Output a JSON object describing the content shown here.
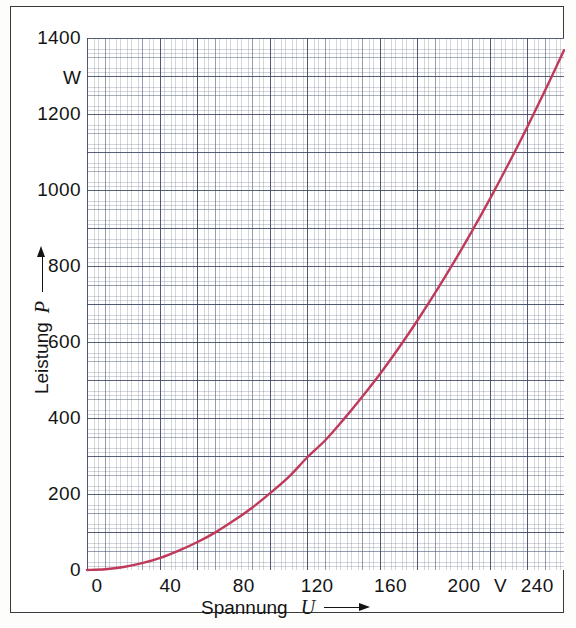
{
  "chart_data": {
    "type": "line",
    "title": "",
    "xlabel": "Spannung U",
    "ylabel": "Leistung P",
    "x_unit": "V",
    "y_unit": "W",
    "xlim": [
      0,
      260
    ],
    "ylim": [
      0,
      1400
    ],
    "grid": "graph-paper",
    "legend": "none",
    "x_ticks": [
      0,
      40,
      80,
      120,
      160,
      200,
      240
    ],
    "x_tick_labels": [
      "0",
      "40",
      "80",
      "120",
      "160",
      "200",
      "240"
    ],
    "y_ticks": [
      0,
      200,
      400,
      600,
      800,
      1000,
      1200,
      1400
    ],
    "y_tick_labels": [
      "0",
      "200",
      "400",
      "600",
      "800",
      "1000",
      "1200",
      "1400"
    ],
    "series": [
      {
        "name": "P = U² / R",
        "color": "#c0395a",
        "x": [
          0,
          10,
          20,
          30,
          40,
          50,
          60,
          70,
          80,
          90,
          100,
          110,
          120,
          130,
          140,
          150,
          160,
          170,
          180,
          190,
          200,
          210,
          220,
          230,
          240,
          250,
          260
        ],
        "y": [
          0,
          2,
          8,
          18,
          32,
          51,
          73,
          99,
          130,
          164,
          203,
          245,
          296,
          342,
          397,
          456,
          518,
          585,
          656,
          731,
          810,
          893,
          980,
          1071,
          1166,
          1265,
          1368
        ]
      }
    ]
  },
  "axes": {
    "y_title": "Leistung",
    "y_variable": "P",
    "y_unit": "W",
    "x_title": "Spannung",
    "x_variable": "U",
    "x_unit": "V"
  }
}
